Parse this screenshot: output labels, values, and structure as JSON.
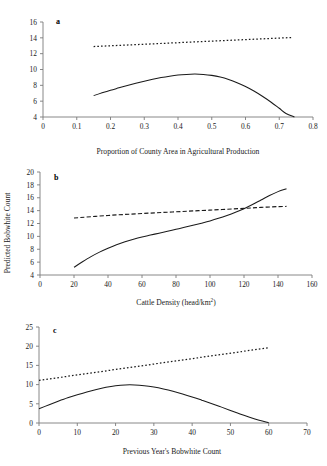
{
  "figure": {
    "ylabel_shared": "Predicted Bobwhite Count",
    "panel_tags": [
      "a",
      "b",
      "c"
    ]
  },
  "chart_data": [
    {
      "type": "line",
      "panel": "a",
      "title": "",
      "xlabel": "Proportion of County Area in Agricultural Production",
      "ylabel": "Predicted Bobwhite Count",
      "xlim": [
        0,
        0.8
      ],
      "ylim": [
        4,
        16
      ],
      "xticks": [
        "0",
        "0.1",
        "0.2",
        "0.3",
        "0.4",
        "0.5",
        "0.6",
        "0.7",
        "0.8"
      ],
      "xtickvals": [
        0,
        0.1,
        0.2,
        0.3,
        0.4,
        0.5,
        0.6,
        0.7,
        0.8
      ],
      "yticks": [
        "4",
        "6",
        "8",
        "10",
        "12",
        "14",
        "16"
      ],
      "ytickvals": [
        4,
        6,
        8,
        10,
        12,
        14,
        16
      ],
      "grid": false,
      "legend": "none",
      "series": [
        {
          "name": "solid-curve",
          "style": "solid",
          "x": [
            0.15,
            0.175,
            0.2,
            0.225,
            0.25,
            0.275,
            0.3,
            0.325,
            0.35,
            0.375,
            0.4,
            0.425,
            0.45,
            0.475,
            0.5,
            0.525,
            0.55,
            0.575,
            0.6,
            0.625,
            0.65,
            0.675,
            0.7,
            0.72,
            0.745
          ],
          "y": [
            6.7,
            7.05,
            7.38,
            7.68,
            7.98,
            8.26,
            8.52,
            8.76,
            8.98,
            9.16,
            9.3,
            9.38,
            9.42,
            9.38,
            9.26,
            9.05,
            8.74,
            8.34,
            7.85,
            7.28,
            6.62,
            5.9,
            5.1,
            4.45,
            4.0
          ]
        },
        {
          "name": "dotted-line",
          "style": "dotted",
          "x": [
            0.15,
            0.74
          ],
          "y": [
            12.9,
            14.05
          ]
        }
      ]
    },
    {
      "type": "line",
      "panel": "b",
      "title": "",
      "xlabel": "Cattle Density (head/km2)",
      "xlabel_base": "Cattle Density (head/km",
      "xlabel_sup": "2",
      "xlabel_tail": ")",
      "ylabel": "Predicted Bobwhite Count",
      "xlim": [
        0,
        160
      ],
      "ylim": [
        4,
        20
      ],
      "xticks": [
        "0",
        "20",
        "40",
        "60",
        "80",
        "100",
        "120",
        "140",
        "160"
      ],
      "xtickvals": [
        0,
        20,
        40,
        60,
        80,
        100,
        120,
        140,
        160
      ],
      "yticks": [
        "4",
        "6",
        "8",
        "10",
        "12",
        "14",
        "16",
        "18",
        "20"
      ],
      "ytickvals": [
        4,
        6,
        8,
        10,
        12,
        14,
        16,
        18,
        20
      ],
      "grid": false,
      "legend": "none",
      "series": [
        {
          "name": "solid-curve",
          "style": "solid",
          "x": [
            20,
            25,
            30,
            35,
            40,
            45,
            50,
            55,
            60,
            65,
            70,
            75,
            80,
            85,
            90,
            95,
            100,
            105,
            110,
            115,
            120,
            125,
            130,
            135,
            140,
            145
          ],
          "y": [
            5.2,
            6.05,
            6.85,
            7.55,
            8.15,
            8.7,
            9.15,
            9.55,
            9.9,
            10.2,
            10.5,
            10.8,
            11.1,
            11.4,
            11.72,
            12.05,
            12.4,
            12.8,
            13.25,
            13.75,
            14.3,
            14.95,
            15.65,
            16.35,
            16.95,
            17.4
          ]
        },
        {
          "name": "dashed-line",
          "style": "dashed",
          "x": [
            20,
            40,
            60,
            80,
            100,
            120,
            130,
            140,
            145
          ],
          "y": [
            12.85,
            13.25,
            13.55,
            13.82,
            14.08,
            14.35,
            14.5,
            14.62,
            14.65
          ]
        }
      ]
    },
    {
      "type": "line",
      "panel": "c",
      "title": "",
      "xlabel": "Previous Year's Bobwhite Count",
      "ylabel": "Predicted Bobwhite Count",
      "xlim": [
        0,
        70
      ],
      "ylim": [
        0,
        25
      ],
      "xticks": [
        "0",
        "10",
        "20",
        "30",
        "40",
        "50",
        "60",
        "70"
      ],
      "xtickvals": [
        0,
        10,
        20,
        30,
        40,
        50,
        60,
        70
      ],
      "yticks": [
        "0",
        "5",
        "10",
        "15",
        "20",
        "25"
      ],
      "ytickvals": [
        0,
        5,
        10,
        15,
        20,
        25
      ],
      "grid": false,
      "legend": "none",
      "series": [
        {
          "name": "solid-curve",
          "style": "solid",
          "x": [
            0,
            2.5,
            5,
            7.5,
            10,
            12.5,
            15,
            17.5,
            20,
            22.5,
            25,
            27.5,
            30,
            32.5,
            35,
            37.5,
            40,
            42.5,
            45,
            47.5,
            50,
            52.5,
            55,
            57.5,
            60
          ],
          "y": [
            3.7,
            4.7,
            5.65,
            6.55,
            7.35,
            8.1,
            8.75,
            9.3,
            9.7,
            9.92,
            9.92,
            9.72,
            9.35,
            8.85,
            8.25,
            7.55,
            6.78,
            5.95,
            5.1,
            4.2,
            3.28,
            2.35,
            1.5,
            0.72,
            0.05
          ]
        },
        {
          "name": "dotted-line",
          "style": "dotted",
          "x": [
            0,
            60
          ],
          "y": [
            11.1,
            19.6
          ]
        }
      ]
    }
  ]
}
